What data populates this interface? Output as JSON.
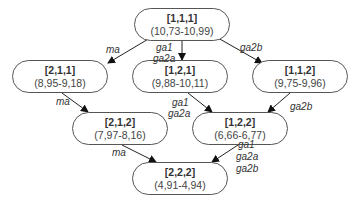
{
  "nodes": [
    {
      "key": "n111",
      "id": "[1,1,1]",
      "range": "(10,73-10,99)",
      "x": 134,
      "y": 8,
      "w": 96,
      "h": 33
    },
    {
      "key": "n211",
      "id": "[2,1,1]",
      "range": "(8,95-9,18)",
      "x": 12,
      "y": 60,
      "w": 96,
      "h": 33
    },
    {
      "key": "n121",
      "id": "[1,2,1]",
      "range": "(9,88-10,11)",
      "x": 132,
      "y": 60,
      "w": 96,
      "h": 33
    },
    {
      "key": "n112",
      "id": "[1,1,2]",
      "range": "(9,75-9,96)",
      "x": 252,
      "y": 60,
      "w": 96,
      "h": 33
    },
    {
      "key": "n212",
      "id": "[2,1,2]",
      "range": "(7,97-8,16)",
      "x": 72,
      "y": 112,
      "w": 96,
      "h": 33
    },
    {
      "key": "n122",
      "id": "[1,2,2]",
      "range": "(6,66-6,77)",
      "x": 192,
      "y": 112,
      "w": 96,
      "h": 33
    },
    {
      "key": "n222",
      "id": "[2,2,2]",
      "range": "(4,91-4,94)",
      "x": 132,
      "y": 162,
      "w": 96,
      "h": 33
    }
  ],
  "edges": [
    {
      "from": "[1,1,1]",
      "to": "[2,1,1]",
      "x1": 150,
      "y1": 38,
      "x2": 108,
      "y2": 63
    },
    {
      "from": "[1,1,1]",
      "to": "[1,2,1]",
      "x1": 182,
      "y1": 41,
      "x2": 182,
      "y2": 60
    },
    {
      "from": "[1,1,1]",
      "to": "[1,1,2]",
      "x1": 218,
      "y1": 38,
      "x2": 262,
      "y2": 63
    },
    {
      "from": "[2,1,1]",
      "to": "[2,1,2]",
      "x1": 62,
      "y1": 93,
      "x2": 88,
      "y2": 112
    },
    {
      "from": "[1,2,1]",
      "to": "[1,2,2]",
      "x1": 188,
      "y1": 93,
      "x2": 212,
      "y2": 112
    },
    {
      "from": "[1,1,2]",
      "to": "[1,2,2]",
      "x1": 290,
      "y1": 93,
      "x2": 268,
      "y2": 112
    },
    {
      "from": "[2,1,2]",
      "to": "[2,2,2]",
      "x1": 122,
      "y1": 145,
      "x2": 156,
      "y2": 162
    },
    {
      "from": "[1,2,2]",
      "to": "[2,2,2]",
      "x1": 238,
      "y1": 145,
      "x2": 212,
      "y2": 162
    }
  ],
  "labels": [
    {
      "text": "ma",
      "x": 106,
      "y": 44
    },
    {
      "text": "ga1",
      "x": 156,
      "y": 42
    },
    {
      "text": "ga2a",
      "x": 153,
      "y": 53
    },
    {
      "text": "ga2b",
      "x": 240,
      "y": 42
    },
    {
      "text": "ma",
      "x": 56,
      "y": 96
    },
    {
      "text": "ga1",
      "x": 172,
      "y": 97
    },
    {
      "text": "ga2a",
      "x": 168,
      "y": 108
    },
    {
      "text": "ga2b",
      "x": 290,
      "y": 101
    },
    {
      "text": "ma",
      "x": 112,
      "y": 147
    },
    {
      "text": "ga1",
      "x": 238,
      "y": 139
    },
    {
      "text": "ga2a",
      "x": 236,
      "y": 151
    },
    {
      "text": "ga2b",
      "x": 236,
      "y": 163
    }
  ]
}
